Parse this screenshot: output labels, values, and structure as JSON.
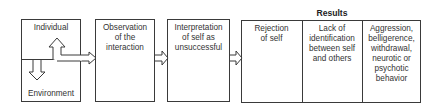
{
  "diagram": {
    "nodes": {
      "individual": {
        "label": "Individual"
      },
      "environment": {
        "label": "Environment"
      },
      "observation": {
        "label": "Observation of the interaction",
        "lines": [
          "Observation",
          "of the",
          "interaction"
        ]
      },
      "interpretation": {
        "label": "Interpretation of self as unsuccessful",
        "lines": [
          "Interpretation",
          "of self as",
          "unsuccessful"
        ]
      }
    },
    "results": {
      "title": "Results",
      "items": [
        {
          "label": "Rejection of self",
          "lines": [
            "Rejection",
            "of self"
          ]
        },
        {
          "label": "Lack of identification between self and others",
          "lines": [
            "Lack of",
            "identification",
            "between self",
            "and others"
          ]
        },
        {
          "label": "Aggression, belligerence, withdrawal, neurotic or psychotic behavior",
          "lines": [
            "Aggression,",
            "belligerence,",
            "withdrawal,",
            "neurotic or",
            "psychotic",
            "behavior"
          ]
        }
      ]
    },
    "edges": [
      {
        "from": "environment",
        "to": "individual",
        "type": "double-line-arrow-up"
      },
      {
        "from": "individual",
        "to": "environment",
        "type": "double-line-arrow-down"
      },
      {
        "from": "individual-environment",
        "to": "observation",
        "type": "double-line-arrow-right"
      },
      {
        "from": "observation",
        "to": "interpretation",
        "type": "double-line-arrow-right"
      },
      {
        "from": "interpretation",
        "to": "results",
        "type": "double-line-arrow-right"
      }
    ],
    "colors": {
      "line": "#3a3a3a",
      "text": "#333333",
      "background": "#ffffff"
    }
  }
}
